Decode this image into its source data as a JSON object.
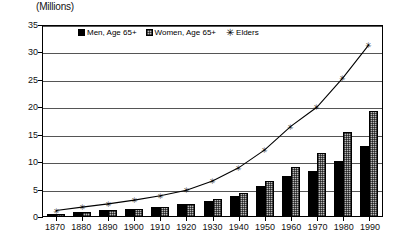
{
  "chart_data": {
    "type": "bar",
    "title": "",
    "ylabel": "(Millions)",
    "xlabel": "",
    "ylim": [
      0,
      35
    ],
    "yticks": [
      0,
      5,
      10,
      15,
      20,
      25,
      30,
      35
    ],
    "grid": true,
    "legend_position": "top-center",
    "categories": [
      "1870",
      "1880",
      "1890",
      "1900",
      "1910",
      "1920",
      "1930",
      "1940",
      "1950",
      "1960",
      "1970",
      "1980",
      "1990"
    ],
    "series": [
      {
        "name": "Men, Age 65+",
        "type": "bar",
        "color": "#000000",
        "values": [
          0.6,
          0.9,
          1.2,
          1.5,
          1.9,
          2.3,
          3.0,
          3.9,
          5.6,
          7.5,
          8.4,
          10.3,
          13.0
        ]
      },
      {
        "name": "Women, Age 65+",
        "type": "bar",
        "color": "#b9b9b9",
        "values": [
          0.6,
          0.9,
          1.2,
          1.5,
          1.8,
          2.3,
          3.2,
          4.4,
          6.5,
          9.1,
          11.7,
          15.5,
          19.4
        ]
      },
      {
        "name": "Elders",
        "type": "line",
        "color": "#000000",
        "marker": "star",
        "values": [
          1.2,
          1.8,
          2.4,
          3.1,
          3.9,
          4.9,
          6.6,
          9.0,
          12.3,
          16.6,
          20.1,
          25.5,
          31.6
        ]
      }
    ]
  },
  "legend": {
    "items": [
      {
        "label": "Men, Age 65+",
        "swatch": "solid-black-square-icon"
      },
      {
        "label": "Women, Age 65+",
        "swatch": "hatched-gray-square-icon"
      },
      {
        "label": "Elders",
        "swatch": "star-marker-icon",
        "glyph": "✳"
      }
    ]
  }
}
